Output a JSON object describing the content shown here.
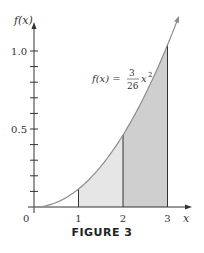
{
  "chart_data": {
    "type": "area",
    "title": "",
    "function_label": "f(x) = 3/26 x^2",
    "function_label_parts": {
      "lhs": "f(x) =",
      "num": "3",
      "den": "26",
      "var": "x",
      "exp": "2"
    },
    "xlabel": "x",
    "ylabel": "f(x)",
    "xlim": [
      0,
      3.5
    ],
    "ylim": [
      0,
      1.15
    ],
    "x_ticks": [
      0,
      1,
      2,
      3
    ],
    "x_tick_labels": [
      "0",
      "1",
      "2",
      "3"
    ],
    "y_ticks": [
      0.1,
      0.2,
      0.3,
      0.4,
      0.5,
      0.6,
      0.7,
      0.8,
      0.9,
      1.0
    ],
    "y_tick_labels": {
      "0.5": "0.5",
      "1.0": "1.0"
    },
    "curve": {
      "x": [
        0,
        0.5,
        1,
        1.5,
        2,
        2.5,
        3,
        3.2
      ],
      "y": [
        0,
        0.029,
        0.115,
        0.26,
        0.462,
        0.721,
        1.038,
        1.181
      ]
    },
    "shaded_regions": [
      {
        "from": 1,
        "to": 2,
        "shade": "light",
        "color": "#e6e6e6"
      },
      {
        "from": 2,
        "to": 3,
        "shade": "dark",
        "color": "#cfcfcf"
      }
    ],
    "vertical_lines_at": [
      1,
      2,
      3
    ],
    "grid": false,
    "legend": "none"
  },
  "figure": {
    "caption": "FIGURE 3",
    "origin_label": "0",
    "colors": {
      "curve": "#8c8c8c",
      "axis": "#333333",
      "light_fill": "#e6e6e6",
      "dark_fill": "#cfcfcf"
    }
  }
}
